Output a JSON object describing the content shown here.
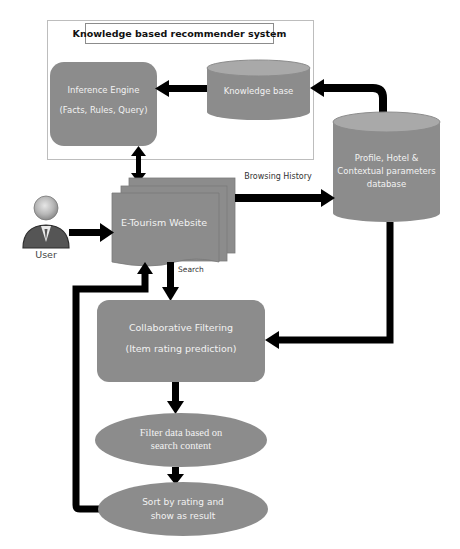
{
  "header": {
    "running_title": ""
  },
  "diagram": {
    "title": "Knowledge based recommender system",
    "nodes": {
      "inference_engine": {
        "line1": "Inference Engine",
        "line2": "(Facts, Rules, Query)",
        "shape": "rounded-rect"
      },
      "knowledge_base": {
        "label": "Knowledge base",
        "shape": "cylinder"
      },
      "database": {
        "line1": "Profile, Hotel &",
        "line2": "Contextual parameters",
        "line3": "database",
        "shape": "cylinder"
      },
      "website": {
        "label": "E-Tourism Website",
        "shape": "multi-document"
      },
      "user": {
        "label": "User",
        "shape": "person-icon"
      },
      "collaborative_filtering": {
        "line1": "Collaborative Filtering",
        "line2": "(Item rating prediction)",
        "shape": "rounded-rect"
      },
      "filter_data": {
        "line1": "Filter data based on",
        "line2": "search content",
        "shape": "ellipse"
      },
      "sort_result": {
        "line1": "Sort by rating and",
        "line2": "show as result",
        "shape": "ellipse"
      }
    },
    "edge_labels": {
      "browsing_history": "Browsing History",
      "search": "Search"
    },
    "edges": [
      {
        "from": "knowledge_base",
        "to": "inference_engine"
      },
      {
        "from": "database",
        "to": "knowledge_base"
      },
      {
        "from": "inference_engine",
        "to": "website",
        "bidirectional": true
      },
      {
        "from": "website",
        "to": "database",
        "label": "Browsing History"
      },
      {
        "from": "user",
        "to": "website"
      },
      {
        "from": "website",
        "to": "collaborative_filtering",
        "label": "Search"
      },
      {
        "from": "database",
        "to": "collaborative_filtering"
      },
      {
        "from": "collaborative_filtering",
        "to": "filter_data"
      },
      {
        "from": "filter_data",
        "to": "sort_result"
      },
      {
        "from": "sort_result",
        "to": "website"
      }
    ],
    "colors": {
      "node_fill": "#8c8c8c",
      "cylinder_top": "#a9a9a9",
      "arrow": "#000000",
      "frame": "#bdbdbd"
    }
  }
}
